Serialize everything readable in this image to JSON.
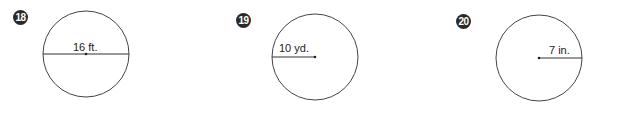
{
  "problems": [
    {
      "number": "18",
      "label": "16 ft.",
      "measure": "diameter"
    },
    {
      "number": "19",
      "label": "10 yd.",
      "measure": "radius"
    },
    {
      "number": "20",
      "label": "7 in.",
      "measure": "radius"
    }
  ]
}
